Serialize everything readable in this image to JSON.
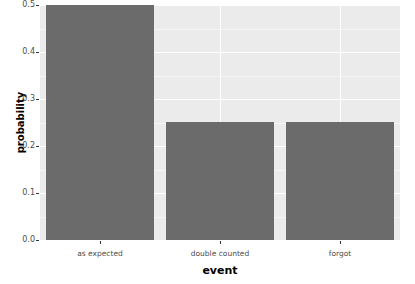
{
  "chart_data": {
    "type": "bar",
    "title": "",
    "subtitle": "",
    "xlabel": "event",
    "ylabel": "probability",
    "categories": [
      "as expected",
      "double counted",
      "forgot"
    ],
    "values": [
      0.5,
      0.25,
      0.25
    ],
    "ylim": [
      0.0,
      0.5
    ],
    "yticks": [
      "0.0",
      "0.1",
      "0.2",
      "0.3",
      "0.4",
      "0.5"
    ],
    "ytick_values": [
      0.0,
      0.1,
      0.2,
      0.3,
      0.4,
      0.5
    ],
    "yminor_values": [
      0.05,
      0.15,
      0.25,
      0.35,
      0.45
    ],
    "grid": true,
    "legend": "none",
    "bar_color": "#6b6b6b",
    "panel_background": "#ebebeb",
    "gridline_color": "#ffffff",
    "plot_background": "#ffffff"
  }
}
